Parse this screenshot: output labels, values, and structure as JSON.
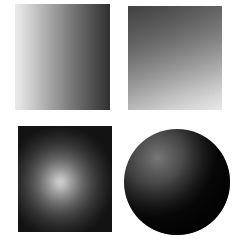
{
  "figure": {
    "background_color": "#ffffff",
    "width": 237,
    "height": 239,
    "layout": "2x2 grid of grayscale gradient swatches"
  },
  "panels": [
    {
      "id": "panel-linear-horizontal",
      "name": "Linear horizontal gradient",
      "position": "top-left",
      "shape": "rectangle",
      "gradient_type": "linear",
      "direction": "left-to-right",
      "light_color": "#eaeaea",
      "dark_color": "#303030",
      "light_edge": "left",
      "dark_edge": "right",
      "x": 15,
      "y": 4,
      "width": 95,
      "height": 106
    },
    {
      "id": "panel-linear-diagonal",
      "name": "Linear diagonal gradient",
      "position": "top-right",
      "shape": "rectangle",
      "gradient_type": "linear",
      "direction": "top-to-bottom-diagonal",
      "light_color": "#e6e6e6",
      "dark_color": "#4a4a4a",
      "light_edge": "bottom",
      "dark_edge": "top-left",
      "angle_deg": 170,
      "x": 128,
      "y": 6,
      "width": 94,
      "height": 104
    },
    {
      "id": "panel-radial",
      "name": "Radial gradient",
      "position": "bottom-left",
      "shape": "rectangle",
      "gradient_type": "radial",
      "direction": "center-outward",
      "light_color": "#cecece",
      "dark_color": "#131313",
      "light_edge": "center",
      "dark_edge": "corners",
      "center_x_pct": 45,
      "center_y_pct": 53,
      "x": 18,
      "y": 126,
      "width": 94,
      "height": 106
    },
    {
      "id": "panel-sphere",
      "name": "Shaded sphere",
      "position": "bottom-right",
      "shape": "circle",
      "gradient_type": "radial",
      "direction": "highlight-upper-left",
      "light_color": "#767676",
      "dark_color": "#040404",
      "light_edge": "upper-left",
      "dark_edge": "lower-right",
      "highlight_x_pct": 32,
      "highlight_y_pct": 27,
      "x": 124,
      "y": 129,
      "width": 106,
      "height": 106
    }
  ]
}
